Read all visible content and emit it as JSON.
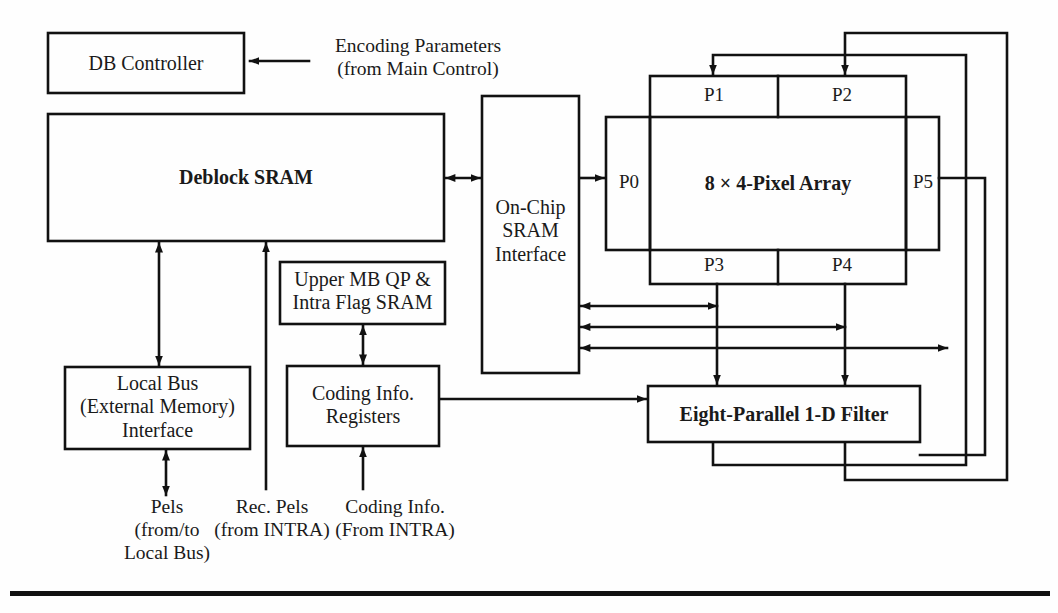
{
  "figure": {
    "background": "#fefefe",
    "line_color": "#111111",
    "text_color": "#1a1a1a"
  },
  "blocks": {
    "db_controller": {
      "label": "DB Controller",
      "x": 48,
      "y": 33,
      "w": 196,
      "h": 60
    },
    "deblock_sram": {
      "label": "Deblock SRAM",
      "x": 48,
      "y": 114,
      "w": 396,
      "h": 127
    },
    "onchip_interface": {
      "label": "On-Chip\nSRAM\nInterface",
      "x": 482,
      "y": 96,
      "w": 97,
      "h": 277
    },
    "local_bus": {
      "label": "Local Bus\n(External Memory)\nInterface",
      "x": 65,
      "y": 367,
      "w": 185,
      "h": 82
    },
    "upper_mb_sram": {
      "label": "Upper MB QP &\nIntra Flag SRAM",
      "x": 280,
      "y": 262,
      "w": 165,
      "h": 62
    },
    "coding_info_registers": {
      "label": "Coding Info.\nRegisters",
      "x": 287,
      "y": 366,
      "w": 152,
      "h": 80
    },
    "pixel_array": {
      "label": "8 × 4-Pixel Array",
      "x": 606,
      "y": 117,
      "w": 333,
      "h": 133
    },
    "pixel_column": {
      "x": 650,
      "y": 76,
      "w": 256,
      "h": 208
    },
    "filter": {
      "label": "Eight-Parallel 1-D Filter",
      "x": 648,
      "y": 386,
      "w": 272,
      "h": 56
    }
  },
  "ports": {
    "p0": {
      "label": "P0",
      "x": 628,
      "y": 173
    },
    "p1": {
      "label": "P1",
      "x": 713,
      "y": 96
    },
    "p2": {
      "label": "P2",
      "x": 840,
      "y": 96
    },
    "p3": {
      "label": "P3",
      "x": 713,
      "y": 266
    },
    "p4": {
      "label": "P4",
      "x": 840,
      "y": 266
    },
    "p5": {
      "label": "P5",
      "x": 922,
      "y": 173
    }
  },
  "external_labels": {
    "encoding_parameters": {
      "text": "Encoding Parameters\n(from Main Control)",
      "x": 417,
      "y": 50
    },
    "pels_local_bus": {
      "text": "Pels\n(from/to\nLocal Bus)",
      "x": 166,
      "y": 520
    },
    "rec_pels": {
      "text": "Rec. Pels\n(from INTRA)",
      "x": 272,
      "y": 508
    },
    "coding_info_intra": {
      "text": "Coding Info.\n(From INTRA)",
      "x": 392,
      "y": 508
    }
  },
  "connections": [
    {
      "name": "encoding-params-to-db-controller",
      "style": "arrow-left"
    },
    {
      "name": "deblock-sram-to-onchip-interface",
      "style": "bidirectional"
    },
    {
      "name": "deblock-sram-to-local-bus",
      "style": "bidirectional"
    },
    {
      "name": "local-bus-to-pels-external",
      "style": "bidirectional"
    },
    {
      "name": "rec-pels-to-deblock-sram",
      "style": "arrow-up"
    },
    {
      "name": "coding-info-to-registers",
      "style": "arrow-up"
    },
    {
      "name": "registers-to-upper-mb-sram",
      "style": "bidirectional"
    },
    {
      "name": "registers-to-filter",
      "style": "arrow-right"
    },
    {
      "name": "onchip-interface-to-p0",
      "style": "arrow-right"
    },
    {
      "name": "pixel-array-to-onchip-bus-1",
      "style": "bidirectional"
    },
    {
      "name": "pixel-array-to-onchip-bus-2",
      "style": "bidirectional"
    },
    {
      "name": "pixel-array-to-onchip-bus-3",
      "style": "bidirectional"
    },
    {
      "name": "p3-to-filter",
      "style": "arrow-down"
    },
    {
      "name": "p4-to-filter",
      "style": "arrow-down"
    },
    {
      "name": "filter-feedback-to-p1",
      "style": "arrow-down"
    },
    {
      "name": "filter-feedback-to-p2",
      "style": "arrow-down"
    },
    {
      "name": "p5-feedback-loop",
      "style": "line"
    }
  ],
  "bottom_rule": {
    "x": 10,
    "y": 591,
    "w": 1040,
    "h": 5
  }
}
